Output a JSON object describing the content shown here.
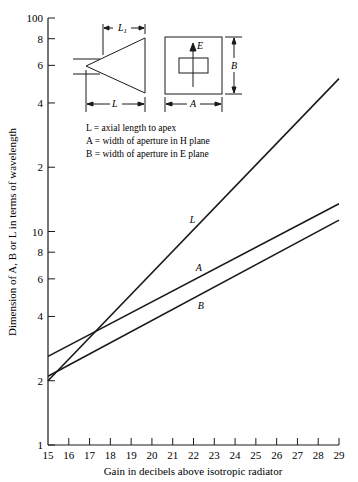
{
  "chart_data": {
    "type": "line",
    "title": "",
    "xlabel": "Gain in decibels above isotropic radiator",
    "ylabel": "Dimension of A, B or L in terms of wavelength",
    "x_scale": "linear",
    "y_scale": "log",
    "xlim": [
      15,
      29
    ],
    "ylim": [
      1,
      100
    ],
    "grid": false,
    "x_ticks": [
      "15",
      "16",
      "17",
      "18",
      "19",
      "20",
      "21",
      "22",
      "23",
      "24",
      "25",
      "26",
      "27",
      "28",
      "29"
    ],
    "y_ticks": [
      "1",
      "2",
      "4",
      "6",
      "8",
      "10",
      "2",
      "4",
      "6",
      "8",
      "100"
    ],
    "series": [
      {
        "name": "L",
        "x": [
          15,
          29
        ],
        "values": [
          2.0,
          52
        ]
      },
      {
        "name": "A",
        "x": [
          15,
          29
        ],
        "values": [
          2.6,
          13.5
        ]
      },
      {
        "name": "B",
        "x": [
          15,
          29
        ],
        "values": [
          2.1,
          11.3
        ]
      }
    ],
    "legend": [
      "L = axial length to apex",
      "A = width of aperture in H plane",
      "B = width of aperture in E plane"
    ],
    "annotations": {
      "horn_side_view": {
        "labels": [
          "L1",
          "L"
        ]
      },
      "horn_front_view": {
        "labels": [
          "E",
          "B",
          "A"
        ]
      }
    }
  }
}
